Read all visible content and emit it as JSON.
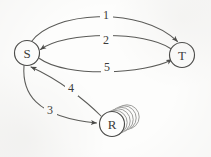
{
  "figure": {
    "background_color": "#fdfdfc",
    "stroke_color": "#5a5a57",
    "node_stroke_color": "#4a4a48",
    "text_color": "#3b3b39"
  },
  "nodes": [
    {
      "id": "S",
      "label": "S",
      "shape": "circle",
      "cx": 27,
      "cy": 53,
      "r": 12.5
    },
    {
      "id": "T",
      "label": "T",
      "shape": "circle",
      "cx": 182,
      "cy": 55,
      "r": 12.5
    },
    {
      "id": "R",
      "label": "R",
      "shape": "disk-stack",
      "cx": 112,
      "cy": 124,
      "r": 12.5,
      "stack_count": 5
    }
  ],
  "edges": [
    {
      "id": "e1",
      "label": "1",
      "from": "S",
      "to": "T",
      "label_x": 106,
      "label_y": 15,
      "direction": "S to T",
      "curve": "arc-over-top"
    },
    {
      "id": "e2",
      "label": "2",
      "from": "T",
      "to": "S",
      "label_x": 106,
      "label_y": 40,
      "direction": "T to S",
      "curve": "arc-shallow-upper"
    },
    {
      "id": "e3",
      "label": "3",
      "from": "S",
      "to": "R",
      "label_x": 50,
      "label_y": 110,
      "direction": "S to R",
      "curve": "arc-lower-left"
    },
    {
      "id": "e4",
      "label": "4",
      "from": "R",
      "to": "S",
      "label_x": 71,
      "label_y": 88,
      "direction": "R to S",
      "curve": "arc-inner-left"
    },
    {
      "id": "e5",
      "label": "5",
      "from": "S",
      "to": "T",
      "label_x": 107,
      "label_y": 67,
      "direction": "S to T",
      "curve": "arc-shallow-lower"
    }
  ],
  "legend": {
    "node_s": "S",
    "node_t": "T",
    "node_r": "R"
  }
}
